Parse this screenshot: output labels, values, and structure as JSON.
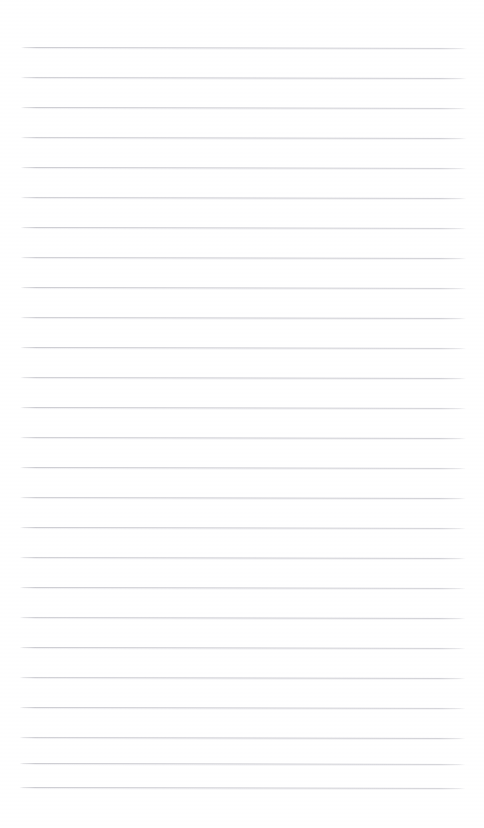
{
  "document": {
    "kind": "ruled-paper-scan",
    "title": "Blank Ruled Page",
    "page_width": 484,
    "page_height": 828,
    "background_color": "#ffffff",
    "has_text_content": false,
    "has_handwriting": false,
    "has_margin_rule": false,
    "has_header": false,
    "has_footer": false,
    "visible_text": []
  },
  "ruling": {
    "line_color": "#c8c8ce",
    "line_color_secondary": "#dcdce2",
    "line_thickness_px": 1,
    "line_count": 26,
    "line_spacing_px": 30,
    "first_line_y": 47,
    "last_line_y": 787,
    "left_margin_x": 21,
    "right_margin_x": 467,
    "line_length_px": 446,
    "scan_skew_deg": 0.12,
    "lines": [
      {
        "index": 1,
        "y": 47,
        "x_start": 21,
        "x_end": 467
      },
      {
        "index": 2,
        "y": 77,
        "x_start": 21,
        "x_end": 467
      },
      {
        "index": 3,
        "y": 107,
        "x_start": 21,
        "x_end": 467
      },
      {
        "index": 4,
        "y": 137,
        "x_start": 21,
        "x_end": 467
      },
      {
        "index": 5,
        "y": 167,
        "x_start": 21,
        "x_end": 467
      },
      {
        "index": 6,
        "y": 197,
        "x_start": 21,
        "x_end": 467
      },
      {
        "index": 7,
        "y": 227,
        "x_start": 21,
        "x_end": 467
      },
      {
        "index": 8,
        "y": 257,
        "x_start": 21,
        "x_end": 467
      },
      {
        "index": 9,
        "y": 287,
        "x_start": 21,
        "x_end": 467
      },
      {
        "index": 10,
        "y": 317,
        "x_start": 21,
        "x_end": 467
      },
      {
        "index": 11,
        "y": 347,
        "x_start": 21,
        "x_end": 467
      },
      {
        "index": 12,
        "y": 377,
        "x_start": 21,
        "x_end": 467
      },
      {
        "index": 13,
        "y": 407,
        "x_start": 21,
        "x_end": 467
      },
      {
        "index": 14,
        "y": 437,
        "x_start": 21,
        "x_end": 467
      },
      {
        "index": 15,
        "y": 467,
        "x_start": 21,
        "x_end": 467
      },
      {
        "index": 16,
        "y": 497,
        "x_start": 21,
        "x_end": 467
      },
      {
        "index": 17,
        "y": 527,
        "x_start": 21,
        "x_end": 467
      },
      {
        "index": 18,
        "y": 557,
        "x_start": 21,
        "x_end": 467
      },
      {
        "index": 19,
        "y": 587,
        "x_start": 21,
        "x_end": 467
      },
      {
        "index": 20,
        "y": 617,
        "x_start": 21,
        "x_end": 467
      },
      {
        "index": 21,
        "y": 647,
        "x_start": 21,
        "x_end": 467
      },
      {
        "index": 22,
        "y": 677,
        "x_start": 21,
        "x_end": 467
      },
      {
        "index": 23,
        "y": 707,
        "x_start": 21,
        "x_end": 467
      },
      {
        "index": 24,
        "y": 737,
        "x_start": 21,
        "x_end": 467
      },
      {
        "index": 25,
        "y": 763,
        "x_start": 21,
        "x_end": 467
      },
      {
        "index": 26,
        "y": 787,
        "x_start": 21,
        "x_end": 467
      }
    ]
  }
}
